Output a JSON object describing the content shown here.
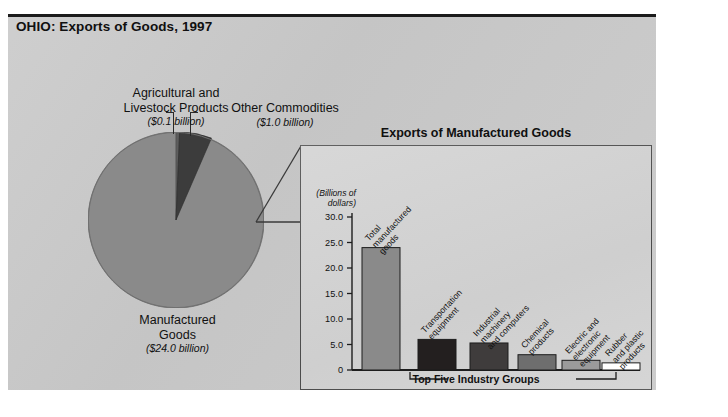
{
  "page": {
    "title": "OHIO: Exports of Goods, 1997"
  },
  "pie": {
    "labels": {
      "agricultural": {
        "name": "Agricultural and Livestock Products",
        "line1": "Agricultural and",
        "line2": "Livestock Products",
        "value": "($0.1 billion)"
      },
      "other": {
        "name": "Other Commodities",
        "line1": "Other Commodities",
        "value": "($1.0 billion)"
      },
      "manufactured": {
        "name": "Manufactured Goods",
        "line1": "Manufactured",
        "line2": "Goods",
        "value": "($24.0 billion)"
      }
    }
  },
  "inset": {
    "title": "Exports of Manufactured Goods",
    "axis_caption_line1": "(Billions of",
    "axis_caption_line2": "dollars)",
    "bracket_label": "Top Five Industry Groups"
  },
  "chart_data": [
    {
      "type": "pie",
      "title": "OHIO: Exports of Goods, 1997",
      "unit": "billions of dollars",
      "categories": [
        "Manufactured Goods",
        "Other Commodities",
        "Agricultural and Livestock Products"
      ],
      "values": [
        24.0,
        1.0,
        0.1
      ],
      "value_labels": [
        "($24.0 billion)",
        "($1.0 billion)",
        "($0.1 billion)"
      ],
      "colors": [
        "#8a8a8a",
        "#3c3c3c",
        "#5d5d5d"
      ],
      "legend": "labels-outside",
      "grid": false
    },
    {
      "type": "bar",
      "title": "Exports of Manufactured Goods",
      "xlabel": "Top Five Industry Groups",
      "ylabel": "(Billions of dollars)",
      "ylim": [
        0,
        30
      ],
      "yticks": [
        "0",
        "5.0",
        "10.0",
        "15.0",
        "20.0",
        "25.0",
        "30.0"
      ],
      "ytick_values": [
        0,
        5,
        10,
        15,
        20,
        25,
        30
      ],
      "grid": false,
      "categories": [
        "Total manufactured goods",
        "Transportation equipment",
        "Industrial machinery and computers",
        "Chemical products",
        "Electric and electronic equipment",
        "Rubber and plastic products"
      ],
      "category_lines": [
        [
          "Total",
          "manufactured",
          "goods"
        ],
        [
          "Transportation",
          "equipment"
        ],
        [
          "Industrial",
          "machinery",
          "and computers"
        ],
        [
          "Chemical",
          "products"
        ],
        [
          "Electric and",
          "electronic",
          "equipment"
        ],
        [
          "Rubber",
          "and plastic",
          "products"
        ]
      ],
      "values": [
        24.0,
        6.0,
        5.3,
        3.0,
        1.9,
        1.4
      ],
      "colors": [
        "#8a8a8a",
        "#231f1f",
        "#3f3c3c",
        "#6e6e6e",
        "#9b9b9b",
        "#ffffff"
      ]
    }
  ]
}
